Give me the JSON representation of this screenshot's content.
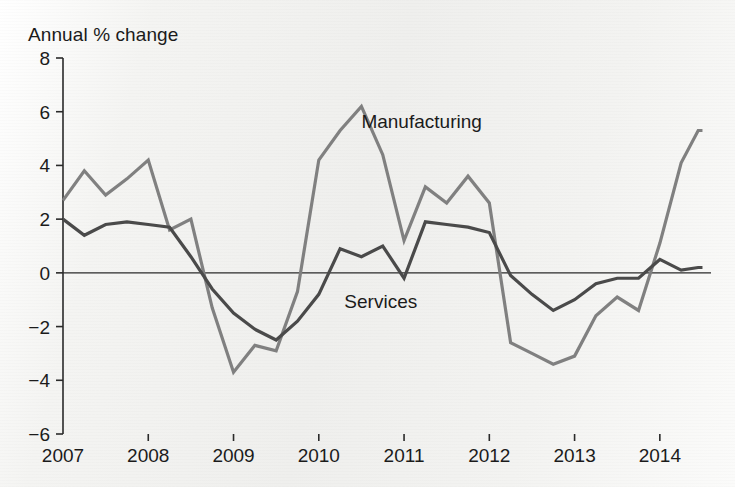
{
  "chart_data": {
    "type": "line",
    "title": "Annual % change",
    "xlabel": "",
    "ylabel": "Annual % change",
    "ylim": [
      -6,
      8
    ],
    "ytick_labels": [
      "8",
      "6",
      "4",
      "2",
      "0",
      "−2",
      "−4",
      "−6"
    ],
    "ytick_values": [
      8,
      6,
      4,
      2,
      0,
      -2,
      -4,
      -6
    ],
    "xlim": [
      2007.0,
      2014.6
    ],
    "xtick_labels": [
      "2007",
      "2008",
      "2009",
      "2010",
      "2011",
      "2012",
      "2013",
      "2014"
    ],
    "xtick_values": [
      2007,
      2008,
      2009,
      2010,
      2011,
      2012,
      2013,
      2014
    ],
    "grid": false,
    "legend_position": "inline-annotation",
    "zero_line": 0,
    "annotations": [
      {
        "text": "Manufacturing",
        "x": 2010.5,
        "y": 5.6,
        "series": "Manufacturing"
      },
      {
        "text": "Services",
        "x": 2010.3,
        "y": -1.1,
        "series": "Services"
      }
    ],
    "series": [
      {
        "name": "Manufacturing",
        "color": "#808080",
        "x": [
          2007.0,
          2007.25,
          2007.5,
          2007.75,
          2008.0,
          2008.25,
          2008.5,
          2008.75,
          2009.0,
          2009.25,
          2009.5,
          2009.75,
          2010.0,
          2010.25,
          2010.5,
          2010.75,
          2011.0,
          2011.25,
          2011.5,
          2011.75,
          2012.0,
          2012.25,
          2012.5,
          2012.75,
          2013.0,
          2013.25,
          2013.5,
          2013.75,
          2014.0,
          2014.25,
          2014.45,
          2014.5
        ],
        "values": [
          2.7,
          3.8,
          2.9,
          3.5,
          4.2,
          1.6,
          2.0,
          -1.3,
          -3.7,
          -2.7,
          -2.9,
          -0.7,
          4.2,
          5.3,
          6.2,
          4.4,
          1.2,
          3.2,
          2.6,
          3.6,
          2.6,
          -2.6,
          -3.0,
          -3.4,
          -3.1,
          -1.6,
          -0.9,
          -1.4,
          1.1,
          4.1,
          5.3,
          5.3
        ]
      },
      {
        "name": "Services",
        "color": "#4a4a4a",
        "x": [
          2007.0,
          2007.25,
          2007.5,
          2007.75,
          2008.0,
          2008.25,
          2008.5,
          2008.75,
          2009.0,
          2009.25,
          2009.5,
          2009.75,
          2010.0,
          2010.25,
          2010.5,
          2010.75,
          2011.0,
          2011.25,
          2011.5,
          2011.75,
          2012.0,
          2012.25,
          2012.5,
          2012.75,
          2013.0,
          2013.25,
          2013.5,
          2013.75,
          2014.0,
          2014.25,
          2014.45,
          2014.5
        ],
        "values": [
          2.0,
          1.4,
          1.8,
          1.9,
          1.8,
          1.7,
          0.6,
          -0.6,
          -1.5,
          -2.1,
          -2.5,
          -1.8,
          -0.8,
          0.9,
          0.6,
          1.0,
          -0.2,
          1.9,
          1.8,
          1.7,
          1.5,
          -0.1,
          -0.8,
          -1.4,
          -1.0,
          -0.4,
          -0.2,
          -0.2,
          0.5,
          0.1,
          0.2,
          0.2
        ]
      }
    ]
  },
  "axis": {
    "title": "Annual % change"
  }
}
